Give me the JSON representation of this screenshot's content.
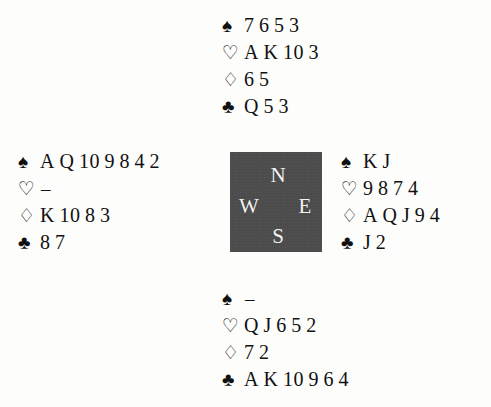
{
  "document": {
    "type": "bridge-deal-diagram",
    "background_color": "#fdfdfc",
    "text_color": "#111111"
  },
  "compass": {
    "box_color": "#4c4c4c",
    "label_color": "#f4f4f2",
    "north": "N",
    "west": "W",
    "east": "E",
    "south": "S"
  },
  "suits": {
    "spade": "♠",
    "heart": "♡",
    "diamond": "♢",
    "club": "♣"
  },
  "hands": {
    "north": {
      "seat": "North",
      "spades": [
        "7",
        "6",
        "5",
        "3"
      ],
      "hearts": [
        "A",
        "K",
        "10",
        "3"
      ],
      "diamonds": [
        "6",
        "5"
      ],
      "clubs": [
        "Q",
        "5",
        "3"
      ]
    },
    "west": {
      "seat": "West",
      "spades": [
        "A",
        "Q",
        "10",
        "9",
        "8",
        "4",
        "2"
      ],
      "hearts": [
        "–"
      ],
      "diamonds": [
        "K",
        "10",
        "8",
        "3"
      ],
      "clubs": [
        "8",
        "7"
      ]
    },
    "east": {
      "seat": "East",
      "spades": [
        "K",
        "J"
      ],
      "hearts": [
        "9",
        "8",
        "7",
        "4"
      ],
      "diamonds": [
        "A",
        "Q",
        "J",
        "9",
        "4"
      ],
      "clubs": [
        "J",
        "2"
      ]
    },
    "south": {
      "seat": "South",
      "spades": [
        "–"
      ],
      "hearts": [
        "Q",
        "J",
        "6",
        "5",
        "2"
      ],
      "diamonds": [
        "7",
        "2"
      ],
      "clubs": [
        "A",
        "K",
        "10",
        "9",
        "6",
        "4"
      ]
    }
  }
}
